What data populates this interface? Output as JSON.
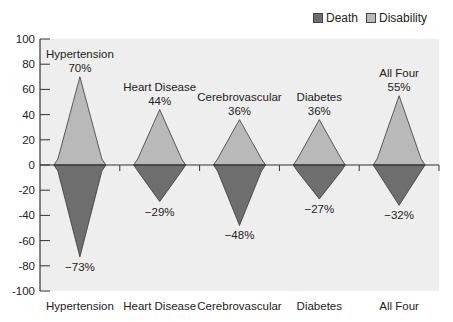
{
  "chart_data": {
    "type": "bar",
    "subtype": "diamond-diverging",
    "title": "",
    "xlabel": "",
    "ylabel": "",
    "ylim": [
      -100,
      100
    ],
    "yticks": [
      100,
      80,
      60,
      40,
      20,
      0,
      -20,
      -40,
      -60,
      -80,
      -100
    ],
    "grid": false,
    "legend_position": "top-right",
    "categories": [
      "Hypertension",
      "Heart Disease",
      "Cerebrovascular",
      "Diabetes",
      "All Four"
    ],
    "series": [
      {
        "name": "Death",
        "color": "#6e6e6e",
        "values": [
          -73,
          -29,
          -48,
          -27,
          -32
        ],
        "labels": [
          "−73%",
          "−29%",
          "−48%",
          "−27%",
          "−32%"
        ]
      },
      {
        "name": "Disability",
        "color": "#b9b9b9",
        "values": [
          70,
          44,
          36,
          36,
          55
        ],
        "labels": [
          "70%",
          "44%",
          "36%",
          "36%",
          "55%"
        ]
      }
    ],
    "annotations": [
      "Hypertension",
      "Heart Disease",
      "Cerebrovascular",
      "Diabetes",
      "All Four"
    ]
  },
  "legend": {
    "items": [
      {
        "label": "Death",
        "color": "#6e6e6e"
      },
      {
        "label": "Disability",
        "color": "#b9b9b9"
      }
    ]
  },
  "colors": {
    "plot_bg": "#eeeeee",
    "axis": "#333333",
    "outline": "#3a3a3a"
  }
}
